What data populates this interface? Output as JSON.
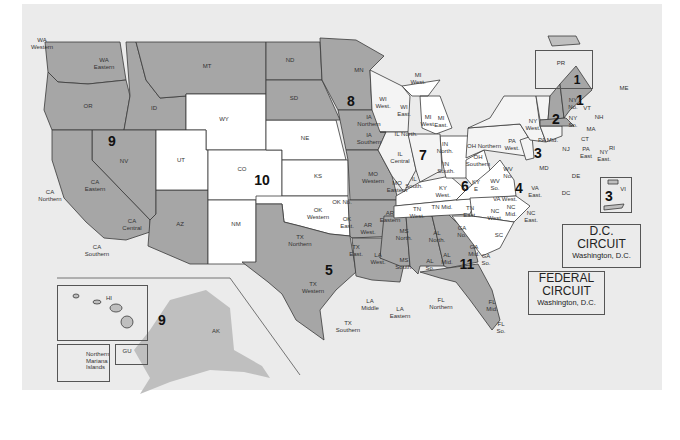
{
  "map": {
    "title": "U.S. Federal Judicial Circuits and Districts",
    "colors": {
      "background": "#ebebeb",
      "circuit_dark": "#a6a6a6",
      "circuit_medium": "#bfbfbf",
      "circuit_light": "#f4f4f4",
      "circuit_white": "#ffffff",
      "border": "#3a3a3a"
    },
    "circuit_numbers": {
      "c1_main": "1",
      "c1_pr": "1",
      "c2": "2",
      "c3_main": "3",
      "c3_vi": "3",
      "c4": "4",
      "c5": "5",
      "c6": "6",
      "c7": "7",
      "c8": "8",
      "c9_main": "9",
      "c9_pacific": "9",
      "c10": "10",
      "c11": "11"
    },
    "districts": {
      "wa_western": "WA\nWestern",
      "wa_eastern": "WA\nEastern",
      "or": "OR",
      "id": "ID",
      "mt": "MT",
      "wy": "WY",
      "nv": "NV",
      "ut": "UT",
      "co": "CO",
      "az": "AZ",
      "nm": "NM",
      "ca_northern": "CA\nNorthern",
      "ca_eastern": "CA\nEastern",
      "ca_central": "CA\nCentral",
      "ca_southern": "CA\nSouthern",
      "nd": "ND",
      "sd": "SD",
      "ne": "NE",
      "ks": "KS",
      "mn": "MN",
      "ia_northern": "IA\nNorthern",
      "ia_southern": "IA\nSouthern",
      "mo_western": "MO\nWestern",
      "mo_eastern": "MO\nEastern",
      "ok_western": "OK\nWestern",
      "ok_no": "OK No.",
      "ok_east": "OK\nEast.",
      "ar_west": "AR\nWest.",
      "ar_eastern": "AR\nEastern",
      "tx_northern": "TX\nNorthern",
      "tx_east": "TX\nEast.",
      "tx_western": "TX\nWestern",
      "tx_southern": "TX\nSouthern",
      "la_west": "LA\nWest.",
      "la_middle": "LA\nMiddle",
      "la_eastern": "LA\nEastern",
      "ms_north": "MS\nNorth.",
      "ms_south": "MS\nSouth.",
      "wi_west": "WI\nWest.",
      "wi_east": "WI\nEast.",
      "mi_west_up": "MI\nWest.",
      "mi_west": "MI\nWest.",
      "mi_east": "MI\nEast.",
      "il_north": "IL North.",
      "il_central": "IL\nCentral",
      "il_south": "IL\nSouth.",
      "in_north": "IN\nNorth.",
      "in_south": "IN\nSouth.",
      "oh_northern": "OH Northern",
      "oh_southern": "OH\nSouthern",
      "ky_west": "KY\nWest.",
      "ky_e": "KY\nE",
      "tn_west": "TN\nWest.",
      "tn_mid": "TN Mid.",
      "tn_east": "TN\nEast.",
      "al_north": "AL\nNorth.",
      "al_mid": "AL\nMid.",
      "al_so": "AL\nSo.",
      "ga_no": "GA\nNo.",
      "ga_mid": "GA\nMid.",
      "ga_so": "GA\nSo.",
      "fl_northern": "FL\nNorthern",
      "fl_mid": "FL\nMid.",
      "fl_so": "FL\nSo.",
      "sc": "SC",
      "nc_west": "NC\nWest.",
      "nc_mid": "NC\nMid.",
      "nc_east": "NC\nEast.",
      "va_west": "VA West.",
      "va_east": "VA\nEast.",
      "wv_no": "WV\nNo.",
      "wv_so": "WV\nSo.",
      "md": "MD",
      "de": "DE",
      "dc": "DC",
      "pa_west": "PA\nWest.",
      "pa_mid": "PA Mid.",
      "pa_east": "PA\nEast",
      "nj": "NJ",
      "ny_west": "NY\nWest.",
      "ny_no": "NY\nNo.",
      "ny_so": "NY\nSo.",
      "ny_east": "NY\nEast.",
      "vt": "VT",
      "nh": "NH",
      "me": "ME",
      "ma": "MA",
      "ct": "CT",
      "ri": "RI",
      "pr": "PR",
      "vi": "VI",
      "hi": "HI",
      "ak": "AK",
      "gu": "GU",
      "northern_mariana": "Northern\nMariana\nIslands"
    },
    "dc_circuit": {
      "line1": "D.C.",
      "line2": "CIRCUIT",
      "location": "Washington, D.C."
    },
    "federal_circuit": {
      "line1": "FEDERAL",
      "line2": "CIRCUIT",
      "location": "Washington, D.C."
    }
  }
}
